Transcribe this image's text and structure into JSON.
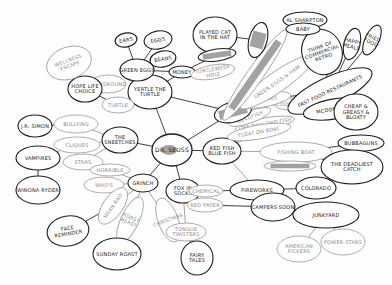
{
  "diagram": {
    "type": "hand-drawn mind map",
    "center": "DR. SEUSS",
    "nodes": [
      {
        "id": "center",
        "label": "DR. SEUSS",
        "style": "dark"
      },
      {
        "id": "turtle",
        "label": "YERTLE THE TURTLE",
        "style": "dark"
      },
      {
        "id": "sneetches",
        "label": "THE SNEETCHES",
        "style": "dark"
      },
      {
        "id": "grinch",
        "label": "GRINCH",
        "style": "dark"
      },
      {
        "id": "foxsocks",
        "label": "FOX IN SOCKS",
        "style": "dark"
      },
      {
        "id": "redfish",
        "label": "RED FISH BLUE FISH",
        "style": "dark"
      },
      {
        "id": "greeneggs",
        "label": "GREEN EGGS",
        "style": "dark"
      },
      {
        "id": "playground",
        "label": "PLAYGROUND",
        "style": "light"
      },
      {
        "id": "ears",
        "label": "EARS",
        "style": "dark"
      },
      {
        "id": "eggs",
        "label": "EGGS",
        "style": "dark"
      },
      {
        "id": "beans",
        "label": "BEANS",
        "style": "dark"
      },
      {
        "id": "money",
        "label": "MONEY",
        "style": "dark"
      },
      {
        "id": "pkt",
        "label": "PLAYED CAT IN THE HAT",
        "style": "dark"
      },
      {
        "id": "scribbled1",
        "label": "(SCRIBBLED)",
        "style": "dark"
      },
      {
        "id": "turtle2",
        "label": "TURTLEWEEK HOLE",
        "style": "light"
      },
      {
        "id": "turtlet",
        "label": "TURTLE",
        "style": "light"
      },
      {
        "id": "hope",
        "label": "HOPE LIFE CHOICE",
        "style": "dark"
      },
      {
        "id": "wellness",
        "label": "WELLNESS ESCAPE",
        "style": "light"
      },
      {
        "id": "jr",
        "label": "J.R. SIMON",
        "style": "dark"
      },
      {
        "id": "bullying",
        "label": "BULLYING",
        "style": "light"
      },
      {
        "id": "vampires",
        "label": "VAMPIRES",
        "style": "dark"
      },
      {
        "id": "winona",
        "label": "WINONA RYDER",
        "style": "dark"
      },
      {
        "id": "cliques",
        "label": "CLIQUES",
        "style": "light"
      },
      {
        "id": "stars",
        "label": "STARS",
        "style": "light"
      },
      {
        "id": "horrible",
        "label": "HORRIBLE",
        "style": "light"
      },
      {
        "id": "who",
        "label": "WHO'S",
        "style": "light"
      },
      {
        "id": "mindbad",
        "label": "MEAN BAD",
        "style": "light"
      },
      {
        "id": "christmas",
        "label": "CHRISTMAS",
        "style": "light"
      },
      {
        "id": "roastbeast",
        "label": "ROAST BEAST",
        "style": "light"
      },
      {
        "id": "sunday",
        "label": "SUNDAY ROAST",
        "style": "dark"
      },
      {
        "id": "face",
        "label": "FACE REMINDER",
        "style": "dark"
      },
      {
        "id": "tonguetw",
        "label": "TONGUE TWISTERS",
        "style": "light"
      },
      {
        "id": "fairy",
        "label": "FAIRY TALES",
        "style": "dark"
      },
      {
        "id": "chemical",
        "label": "CHEMICAL",
        "style": "light"
      },
      {
        "id": "redpaper",
        "label": "RED PAPER",
        "style": "light"
      },
      {
        "id": "fireworks",
        "label": "FIREWORKS",
        "style": "dark"
      },
      {
        "id": "colorado",
        "label": "COLORADO",
        "style": "dark"
      },
      {
        "id": "campers",
        "label": "CAMPERS SOON",
        "style": "dark"
      },
      {
        "id": "junkyard",
        "label": "JUNKYARD",
        "style": "dark"
      },
      {
        "id": "american",
        "label": "AMERICAN PICKERS",
        "style": "light"
      },
      {
        "id": "power",
        "label": "POWER STARS",
        "style": "light"
      },
      {
        "id": "fishing",
        "label": "FISHING BOAT",
        "style": "light"
      },
      {
        "id": "scribbled2",
        "label": "(SCRIBBLED)",
        "style": "light"
      },
      {
        "id": "bubbaguns",
        "label": "BUBBAGUNS",
        "style": "dark"
      },
      {
        "id": "deadliest",
        "label": "THE DEADLIEST CATCH",
        "style": "dark"
      },
      {
        "id": "onefish",
        "label": "ONE FISH TWO FISH",
        "style": "light"
      },
      {
        "id": "floatboat",
        "label": "FLOAT ON BOAT",
        "style": "light"
      },
      {
        "id": "goldfish",
        "label": "GOLDFISH",
        "style": "light"
      },
      {
        "id": "mcdonalds2",
        "label": "MCDONALD'S",
        "style": "light"
      },
      {
        "id": "seuss2",
        "label": "(SCRIBBLED)",
        "style": "dark"
      },
      {
        "id": "regulars",
        "label": "REGULARS",
        "style": "light"
      },
      {
        "id": "green",
        "label": "GREEN EGGS & HAM",
        "style": "light"
      },
      {
        "id": "long",
        "label": "(SCRIBBLED)",
        "style": "light"
      },
      {
        "id": "fastfood",
        "label": "FAST FOOD RESTAURANTS",
        "style": "dark"
      },
      {
        "id": "mcdonalds",
        "label": "MCDONALD'S",
        "style": "dark"
      },
      {
        "id": "heart",
        "label": "THINK OF COMMERCIAL RETRO",
        "style": "dark"
      },
      {
        "id": "happy",
        "label": "HAPPY MEALS",
        "style": "dark"
      },
      {
        "id": "fried",
        "label": "FRIED FOOD",
        "style": "dark"
      },
      {
        "id": "alsharpton",
        "label": "AL SHARPTON",
        "style": "dark"
      },
      {
        "id": "baby",
        "label": "BABY",
        "style": "dark"
      },
      {
        "id": "bear",
        "label": "BEAR",
        "style": "dark"
      },
      {
        "id": "scribbled3",
        "label": "(SCRIBBLED)",
        "style": "dark"
      },
      {
        "id": "cheap",
        "label": "CHEAP & GREASY & BLOATY",
        "style": "dark"
      }
    ]
  }
}
